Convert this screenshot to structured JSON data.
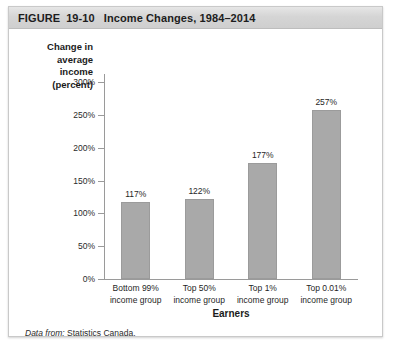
{
  "figure": {
    "label_word": "FIGURE",
    "number": "19-10",
    "title": "Income Changes, 1984–2014",
    "source_lead": "Data from:",
    "source_text": "Statistics Canada."
  },
  "chart_data": {
    "type": "bar",
    "title": "Income Changes, 1984–2014",
    "xlabel": "Earners",
    "ylabel": "Change in average income (percent)",
    "ylabel_lines": [
      "Change in",
      "average",
      "income",
      "(percent)"
    ],
    "categories": [
      "Bottom 99% income group",
      "Top 50% income group",
      "Top 1% income group",
      "Top 0.01% income group"
    ],
    "category_lines": [
      [
        "Bottom 99%",
        "income group"
      ],
      [
        "Top 50%",
        "income group"
      ],
      [
        "Top 1%",
        "income group"
      ],
      [
        "Top 0.01%",
        "income group"
      ]
    ],
    "values": [
      117,
      122,
      177,
      257
    ],
    "value_labels": [
      "117%",
      "122%",
      "177%",
      "257%"
    ],
    "ylim": [
      0,
      300
    ],
    "yticks": [
      0,
      50,
      100,
      150,
      200,
      250,
      300
    ],
    "ytick_labels": [
      "0%",
      "50%",
      "100%",
      "150%",
      "200%",
      "250%",
      "300%"
    ],
    "grid": false,
    "legend": "none",
    "bar_color": "#a9a9a9",
    "axis_color": "#9a9a9a"
  }
}
